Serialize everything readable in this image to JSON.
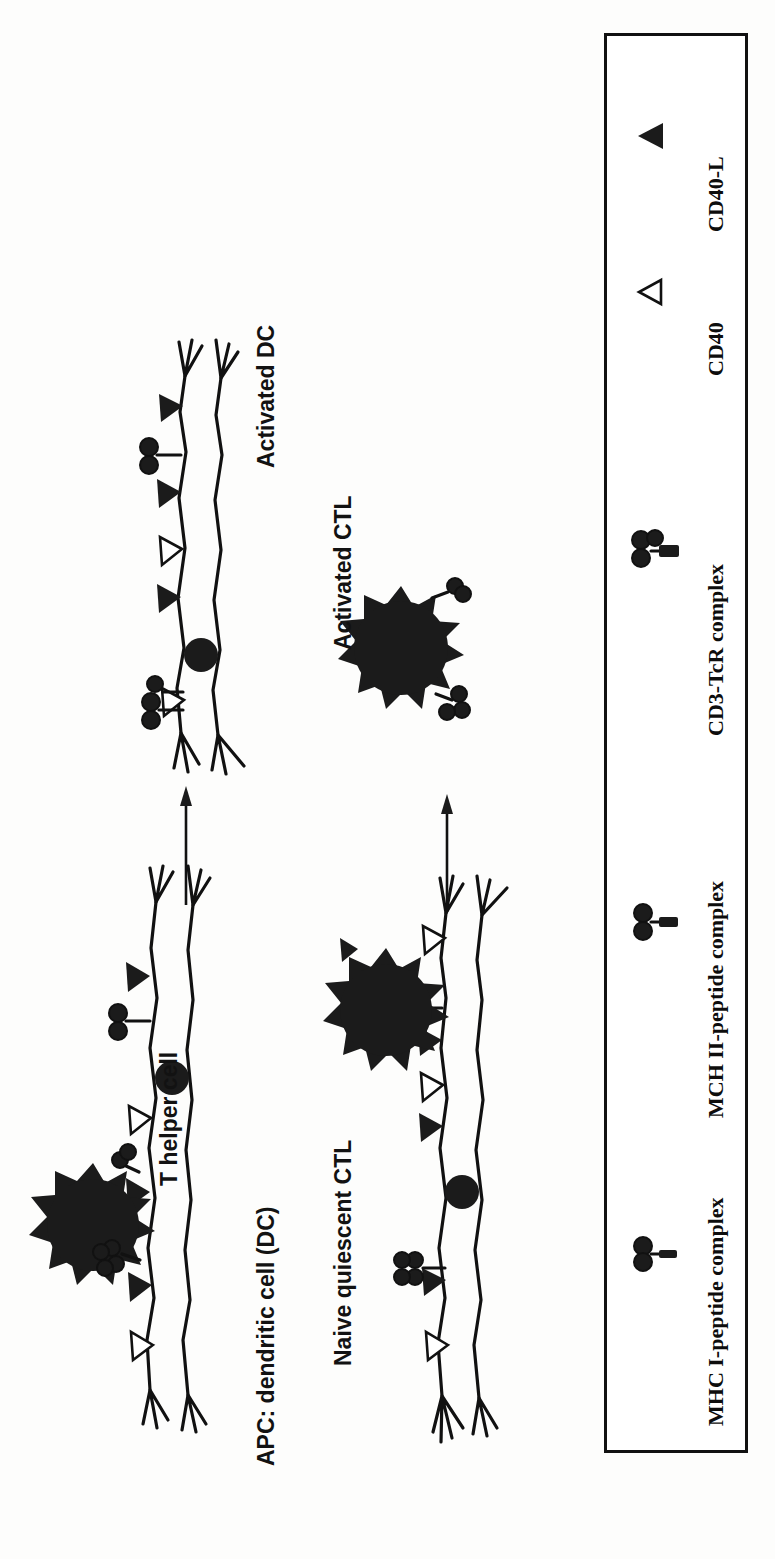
{
  "figure": {
    "kind": "immunology-schematic",
    "orientation": "rotated-90-ccw"
  },
  "labels": {
    "t_helper_cell": "T helper cell",
    "apc_dendritic_cell": "APC: dendritic cell (DC)",
    "activated_dc": "Activated DC",
    "naive_quiescent_ctl": "Naive quiescent CTL",
    "activated_ctl": "Activated CTL"
  },
  "legend": {
    "entries": [
      {
        "id": "mhc1",
        "label": "MHC I-peptide complex",
        "icon": "mhc-i-peptide-complex-icon"
      },
      {
        "id": "mhc2",
        "label": "MCH II-peptide complex",
        "icon": "mhc-ii-peptide-complex-icon"
      },
      {
        "id": "cd3",
        "label": "CD3-TcR complex",
        "icon": "cd3-tcr-complex-icon"
      },
      {
        "id": "cd40",
        "label": "CD40",
        "icon": "cd40-icon"
      },
      {
        "id": "cd40l",
        "label": "CD40-L",
        "icon": "cd40-ligand-icon"
      }
    ]
  },
  "colors": {
    "ink": "#111111",
    "fill_dark": "#1b1b1b",
    "paper": "#fdfdfc",
    "legend_border": "#111111"
  },
  "flow": {
    "arrow_count": 2,
    "direction": "left-to-right-in-rotated-frame",
    "meaning": "activation transition"
  },
  "cells": [
    {
      "id": "th-cell",
      "type": "T helper cell",
      "shape": "spiky-round",
      "stage": "pre-activation"
    },
    {
      "id": "dc-resting",
      "type": "dendritic cell",
      "shape": "elongated-veiled",
      "stage": "resting"
    },
    {
      "id": "dc-activated",
      "type": "dendritic cell",
      "shape": "elongated-veiled",
      "stage": "activated"
    },
    {
      "id": "ctl-naive",
      "type": "CTL",
      "shape": "spiky-round",
      "stage": "naive quiescent"
    },
    {
      "id": "ctl-activated",
      "type": "CTL",
      "shape": "spiky-round",
      "stage": "activated"
    }
  ]
}
